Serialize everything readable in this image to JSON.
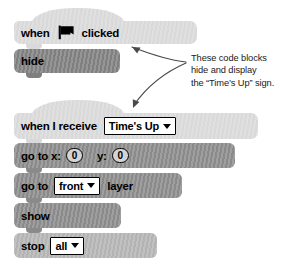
{
  "scripts": [
    {
      "name": "flag-script",
      "blocks": [
        {
          "kind": "hat",
          "name": "when-flag-clicked-block",
          "label_before": "when",
          "icon": "green-flag-icon",
          "label_after": "clicked"
        },
        {
          "kind": "stack",
          "name": "hide-block",
          "label": "hide"
        }
      ]
    },
    {
      "name": "receive-script",
      "blocks": [
        {
          "kind": "hat",
          "name": "when-i-receive-block",
          "label": "when I receive",
          "dropdown": {
            "name": "message-dropdown",
            "value": "Time's Up",
            "icon": "chevron-down-icon"
          }
        },
        {
          "kind": "stack",
          "name": "go-to-xy-block",
          "label_x": "go to x:",
          "value_x": "0",
          "label_y": "y:",
          "value_y": "0"
        },
        {
          "kind": "stack",
          "name": "go-to-layer-block",
          "label_before": "go to",
          "dropdown": {
            "name": "layer-dropdown",
            "value": "front",
            "icon": "chevron-down-icon"
          },
          "label_after": "layer"
        },
        {
          "kind": "stack",
          "name": "show-block",
          "label": "show"
        },
        {
          "kind": "cap",
          "name": "stop-block",
          "label": "stop",
          "dropdown": {
            "name": "stop-target-dropdown",
            "value": "all",
            "icon": "chevron-down-icon"
          }
        }
      ]
    }
  ],
  "annotation": {
    "name": "callout-note",
    "line1": "These code blocks",
    "line2": "hide and display",
    "line3": "the “Time’s Up” sign."
  },
  "colors": {
    "hat_fill": "#d9d9d9",
    "stack_dark": "#7f7f7f",
    "stack_mid": "#8a8a8a",
    "cap_light": "#b3b3b3",
    "field_white": "#ffffff",
    "outline": "#000000",
    "arrow": "#4a4a4a",
    "text": "#000000"
  }
}
